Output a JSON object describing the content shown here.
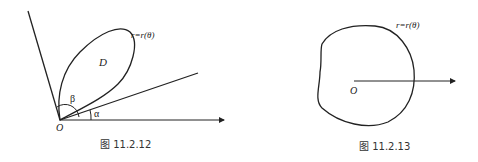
{
  "figures": [
    {
      "id": "fig-11-2-12",
      "caption": "图 11.2.12",
      "curve_label": "r=r(θ)",
      "region_label": "D",
      "origin_label": "O",
      "angle_labels": {
        "alpha": "α",
        "beta": "β"
      }
    },
    {
      "id": "fig-11-2-13",
      "caption": "图 11.2.13",
      "curve_label": "r=r(θ)",
      "origin_label": "O"
    }
  ]
}
